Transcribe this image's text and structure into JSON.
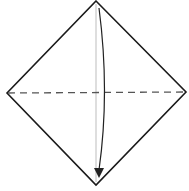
{
  "diagram": {
    "type": "origami-fold-step",
    "shape": "diamond-square",
    "fold_line": {
      "style": "dashed",
      "orientation": "horizontal",
      "kind": "valley-fold"
    },
    "crease_line": {
      "style": "solid-light",
      "orientation": "vertical"
    },
    "arrow": {
      "direction": "down",
      "from": "top-corner",
      "to": "bottom-corner"
    },
    "colors": {
      "outline": "#1a1a1a",
      "fold_line": "#555555",
      "crease": "#c8c8c8",
      "arrow": "#222222",
      "paper": "#ffffff"
    }
  }
}
